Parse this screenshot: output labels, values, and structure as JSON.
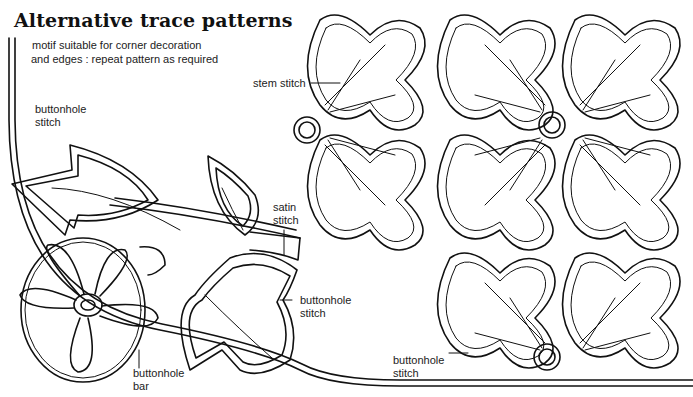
{
  "page": {
    "title": "Alternative trace patterns",
    "subtitle_lines": [
      "motif suitable for corner decoration",
      "and edges : repeat pattern as required"
    ]
  },
  "labels": {
    "buttonhole_stitch_top_left": [
      "buttonhole",
      "stitch"
    ],
    "satin_stitch": [
      "satin",
      "stitch"
    ],
    "buttonhole_stitch_leaf": [
      "buttonhole",
      "stitch"
    ],
    "buttonhole_bar": [
      "buttonhole",
      "bar"
    ],
    "stem_stitch": "stem stitch",
    "buttonhole_stitch_bottom": [
      "buttonhole",
      "stitch"
    ]
  },
  "colors": {
    "ink": "#111111",
    "paper": "#ffffff"
  }
}
